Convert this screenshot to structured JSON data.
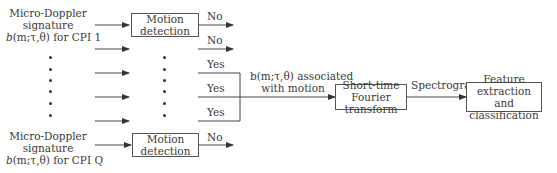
{
  "diagram": {
    "inputs": {
      "first": {
        "line1": "Micro-Doppler",
        "line2": "signature",
        "line3_prefix": "b",
        "line3_args": "(m;τ,θ)",
        "line3_suffix": " for CPI 1"
      },
      "last": {
        "line1": "Micro-Doppler",
        "line2": "signature",
        "line3_prefix": "b",
        "line3_args": "(m;τ,θ)",
        "line3_suffix": " for CPI Q"
      }
    },
    "motion_detection_box": {
      "line1": "Motion",
      "line2": "detection"
    },
    "branch_labels": [
      "No",
      "No",
      "Yes",
      "Yes",
      "Yes",
      "No"
    ],
    "merged_label": {
      "line1": "b(m;τ,θ) associated",
      "line2": "with motion"
    },
    "stft_box": {
      "line1": "Short-time",
      "line2": "Fourier transform"
    },
    "spectrogram_label": "Spectrogram",
    "feature_box": {
      "line1": "Feature extraction",
      "line2": "and classification"
    },
    "ellipsis_dots": "⋮"
  }
}
